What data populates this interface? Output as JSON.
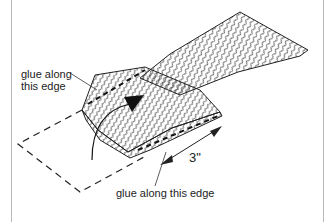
{
  "diagram": {
    "labels": {
      "top_left_line1": "glue along",
      "top_left_line2": "this edge",
      "bottom": "glue along this edge",
      "dimension": "3\""
    },
    "colors": {
      "ink": "#222222",
      "frame_line": "#b9b9b9",
      "background": "#ffffff"
    },
    "elements": [
      "hatched-strip",
      "folded-flap",
      "dashed-outline-unfolded",
      "fold-arrow",
      "dimension-arrow",
      "leader-lines"
    ]
  }
}
